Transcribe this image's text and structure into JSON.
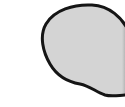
{
  "shape": {
    "type": "blob",
    "fill_color": "#d4d4d4",
    "stroke_color": "#151515",
    "edge_shade_color": "#9a9a9a",
    "background_color": "#ffffff"
  }
}
